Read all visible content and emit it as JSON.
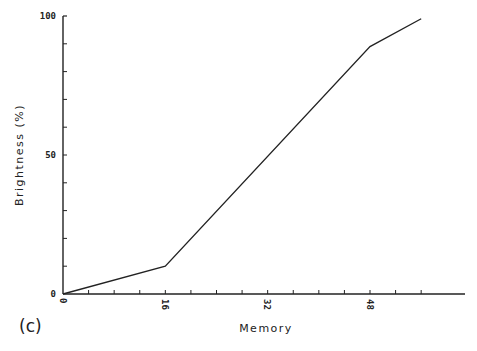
{
  "chart_data": {
    "type": "line",
    "title": "",
    "panel_label": "(c)",
    "xlabel": "Memory",
    "ylabel": "Brightness (%)",
    "xlim": [
      0,
      56
    ],
    "ylim": [
      0,
      100
    ],
    "x_ticks": [
      0,
      16,
      32,
      48
    ],
    "x_minor_tick_step": 4,
    "y_ticks": [
      0,
      50,
      100
    ],
    "y_minor_tick_step": 10,
    "grid": false,
    "legend": null,
    "series": [
      {
        "name": "Brightness",
        "color": "#222222",
        "points": [
          {
            "x": 0,
            "y": 0
          },
          {
            "x": 16,
            "y": 10
          },
          {
            "x": 48,
            "y": 89
          },
          {
            "x": 56,
            "y": 99
          }
        ]
      }
    ]
  },
  "labels": {
    "panel": "(c)",
    "xlabel": "Memory",
    "ylabel": "Brightness (%)",
    "x_tick_0": "0",
    "x_tick_16": "16",
    "x_tick_32": "32",
    "x_tick_48": "48",
    "y_tick_0": "0",
    "y_tick_50": "50",
    "y_tick_100": "100"
  }
}
